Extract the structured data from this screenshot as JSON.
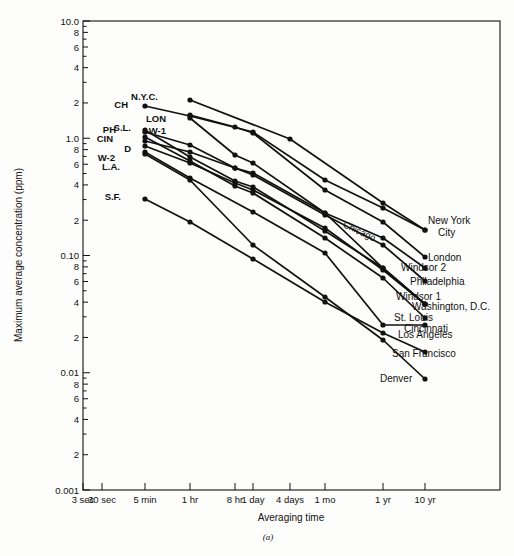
{
  "chart_data": {
    "type": "line",
    "title": "",
    "caption": "(a)",
    "xlabel": "Averaging time",
    "ylabel": "Maximum average concentration (ppm)",
    "xscale": "log",
    "yscale": "log",
    "grid": false,
    "legend": "inline-endpoint-labels",
    "ylim": [
      0.001,
      10.0
    ],
    "y_major_ticks": [
      "10.0",
      "1.0",
      "0.10",
      "0.01",
      "0.001"
    ],
    "y_minor_ticks": [
      "8",
      "6",
      "4",
      "2"
    ],
    "x_tick_labels": [
      "3 sec",
      "30 sec",
      "5 min",
      "1 hr",
      "8 hr",
      "1 day",
      "4 days",
      "1 mo",
      "1 yr",
      "10 yr"
    ],
    "x_tick_px": [
      83,
      102,
      145,
      190,
      235,
      253,
      290,
      325,
      383,
      425
    ],
    "left_labels": [
      "N.Y.C.",
      "CH",
      "S.L.",
      "PH",
      "CIN",
      "D",
      "W-2",
      "L.A.",
      "S.F.",
      "LON",
      "W-1"
    ],
    "right_labels": [
      "New York City",
      "Chicago",
      "London",
      "Windsor 2",
      "Philadelphia",
      "Windsor 1",
      "Washington, D.C.",
      "St. Louis",
      "Cincinnati",
      "Los Angeles",
      "San Francisco",
      "Denver"
    ],
    "series": [
      {
        "name": "New York City",
        "abbr": "N.Y.C.",
        "end_label": "New York City",
        "x": [
          "1 hr",
          "4 days",
          "1 yr",
          "10 yr"
        ],
        "x_px": [
          190,
          290,
          383,
          425
        ],
        "values": [
          2.0,
          0.5,
          0.04,
          0.019
        ],
        "y_px": [
          100,
          139,
          203,
          230
        ]
      },
      {
        "name": "Chicago",
        "abbr": "CH",
        "end_label": "Chicago",
        "x": [
          "5 min",
          "1 hr",
          "1 day",
          "1 mo",
          "1 yr",
          "10 yr"
        ],
        "x_px": [
          145,
          190,
          253,
          325,
          383,
          425
        ],
        "values": [
          1.6,
          1.2,
          0.62,
          0.14,
          0.035,
          0.019
        ],
        "y_px": [
          106,
          116,
          132,
          180,
          208,
          230
        ]
      },
      {
        "name": "London",
        "abbr": "LON",
        "end_label": "London",
        "x": [
          "1 hr",
          "8 hr",
          "1 day",
          "1 mo",
          "1 yr",
          "10 yr"
        ],
        "x_px": [
          190,
          235,
          253,
          325,
          383,
          425
        ],
        "values": [
          1.25,
          0.78,
          0.6,
          0.1,
          0.022,
          0.0105
        ],
        "y_px": [
          115,
          127,
          133,
          190,
          222,
          257
        ]
      },
      {
        "name": "Windsor 2",
        "abbr": "W-2",
        "end_label": "Windsor 2",
        "x": [
          "5 min",
          "1 hr",
          "8 hr",
          "1 day",
          "1 mo",
          "1 yr",
          "10 yr"
        ],
        "x_px": [
          145,
          190,
          235,
          253,
          325,
          383,
          425
        ],
        "values": [
          0.8,
          0.56,
          0.33,
          0.28,
          0.06,
          0.016,
          0.0085
        ],
        "y_px": [
          141,
          152,
          168,
          173,
          213,
          238,
          268
        ]
      },
      {
        "name": "Philadelphia",
        "abbr": "PH",
        "end_label": "Philadelphia",
        "x": [
          "5 min",
          "1 hr",
          "8 hr",
          "1 day",
          "1 mo",
          "1 yr",
          "10 yr"
        ],
        "x_px": [
          145,
          190,
          235,
          253,
          325,
          383,
          425
        ],
        "values": [
          1.0,
          0.7,
          0.33,
          0.27,
          0.055,
          0.013,
          0.0068
        ],
        "y_px": [
          132,
          145,
          168,
          175,
          215,
          245,
          281
        ]
      },
      {
        "name": "Windsor 1",
        "abbr": "W-1",
        "end_label": "Windsor 1",
        "x": [
          "1 hr",
          "8 hr",
          "1 day",
          "1 mo",
          "1 yr",
          "10 yr"
        ],
        "x_px": [
          190,
          235,
          253,
          325,
          383,
          425
        ],
        "values": [
          1.15,
          0.52,
          0.4,
          0.06,
          0.0085,
          0.0042
        ],
        "y_px": [
          118,
          155,
          163,
          213,
          268,
          304
        ]
      },
      {
        "name": "Washington, D.C.",
        "abbr": "D",
        "end_label": "Washington, D.C.",
        "x": [
          "5 min",
          "1 hr",
          "8 hr",
          "1 day",
          "1 mo",
          "1 yr",
          "10 yr"
        ],
        "x_px": [
          145,
          190,
          235,
          253,
          325,
          383,
          425
        ],
        "values": [
          0.72,
          0.4,
          0.21,
          0.17,
          0.035,
          0.0078,
          0.0042
        ],
        "y_px": [
          146,
          163,
          183,
          190,
          228,
          270,
          304
        ]
      },
      {
        "name": "St. Louis",
        "abbr": "S.L.",
        "end_label": "St. Louis",
        "x": [
          "5 min",
          "1 hr",
          "8 hr",
          "1 day",
          "1 mo",
          "1 yr",
          "10 yr"
        ],
        "x_px": [
          145,
          190,
          235,
          253,
          325,
          383,
          425
        ],
        "values": [
          1.05,
          0.52,
          0.23,
          0.185,
          0.032,
          0.008,
          0.0042
        ],
        "y_px": [
          130,
          157,
          181,
          187,
          231,
          268,
          304
        ]
      },
      {
        "name": "Cincinnati",
        "abbr": "CIN",
        "end_label": "Cincinnati",
        "x": [
          "5 min",
          "1 hr",
          "8 hr",
          "1 day",
          "1 mo",
          "1 yr",
          "10 yr"
        ],
        "x_px": [
          145,
          190,
          235,
          253,
          325,
          383,
          425
        ],
        "values": [
          0.9,
          0.44,
          0.19,
          0.155,
          0.026,
          0.0065,
          0.0035
        ],
        "y_px": [
          137,
          161,
          186,
          193,
          238,
          278,
          318
        ]
      },
      {
        "name": "Los Angeles",
        "abbr": "L.A.",
        "end_label": "Los Angeles",
        "x": [
          "5 min",
          "1 hr",
          "1 day",
          "1 mo",
          "1 yr",
          "10 yr"
        ],
        "x_px": [
          145,
          190,
          253,
          325,
          383,
          425
        ],
        "values": [
          0.62,
          0.3,
          0.082,
          0.0165,
          0.003,
          0.003
        ],
        "y_px": [
          152,
          178,
          212,
          253,
          325,
          325
        ]
      },
      {
        "name": "San Francisco",
        "abbr": "S.F.",
        "end_label": "San Francisco",
        "x": [
          "5 min",
          "1 hr",
          "1 day",
          "1 mo",
          "1 yr",
          "10 yr"
        ],
        "x_px": [
          145,
          190,
          253,
          325,
          383,
          425
        ],
        "values": [
          0.29,
          0.17,
          0.048,
          0.0105,
          0.0032,
          0.0024
        ],
        "y_px": [
          199,
          222,
          259,
          302,
          333,
          352
        ]
      },
      {
        "name": "Denver",
        "abbr": "DEN",
        "end_label": "Denver",
        "x": [
          "5 min",
          "1 hr",
          "1 day",
          "1 mo",
          "1 yr",
          "10 yr"
        ],
        "x_px": [
          145,
          190,
          253,
          325,
          383,
          425
        ],
        "values": [
          0.6,
          0.3,
          0.06,
          0.0082,
          0.0022,
          0.00095
        ],
        "y_px": [
          154,
          180,
          245,
          297,
          340,
          379
        ]
      }
    ],
    "left_annotations": [
      {
        "text": "N.Y.C.",
        "x_px": 158,
        "y_px": 100
      },
      {
        "text": "CH",
        "x_px": 128,
        "y_px": 108
      },
      {
        "text": "S.L.",
        "x_px": 131,
        "y_px": 131
      },
      {
        "text": "PH",
        "x_px": 116,
        "y_px": 133
      },
      {
        "text": "CIN",
        "x_px": 113,
        "y_px": 142
      },
      {
        "text": "D",
        "x_px": 131,
        "y_px": 152
      },
      {
        "text": "W-2",
        "x_px": 115,
        "y_px": 161
      },
      {
        "text": "L.A.",
        "x_px": 120,
        "y_px": 170
      },
      {
        "text": "S.F.",
        "x_px": 121,
        "y_px": 200
      },
      {
        "text": "LON",
        "x_px": 166,
        "y_px": 122
      },
      {
        "text": "W-1",
        "x_px": 166,
        "y_px": 134
      }
    ],
    "right_annotations": [
      {
        "text": "New York",
        "x_px": 428,
        "y_px": 224
      },
      {
        "text": "City",
        "x_px": 438,
        "y_px": 236
      },
      {
        "text": "London",
        "x_px": 428,
        "y_px": 261
      },
      {
        "text": "Windsor 2",
        "x_px": 401,
        "y_px": 271
      },
      {
        "text": "Philadelphia",
        "x_px": 410,
        "y_px": 285
      },
      {
        "text": "Windsor 1",
        "x_px": 396,
        "y_px": 300
      },
      {
        "text": "Washington, D.C.",
        "x_px": 412,
        "y_px": 310
      },
      {
        "text": "St. Louis",
        "x_px": 394,
        "y_px": 321
      },
      {
        "text": "Cincinnati",
        "x_px": 404,
        "y_px": 332
      },
      {
        "text": "Los Angeles",
        "x_px": 398,
        "y_px": 338
      },
      {
        "text": "San Francisco",
        "x_px": 392,
        "y_px": 357
      },
      {
        "text": "Denver",
        "x_px": 380,
        "y_px": 382
      }
    ],
    "rotated_annotations": [
      {
        "text": "Chicago",
        "x_px": 358,
        "y_px": 234,
        "rotate": 25
      }
    ]
  }
}
